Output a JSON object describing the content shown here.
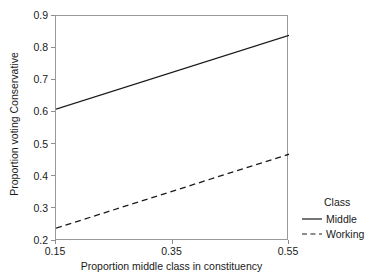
{
  "chart_data": {
    "type": "line",
    "title": "",
    "xlabel": "Proportion middle class in constituency",
    "ylabel": "Proportion voting Conservative",
    "xlim": [
      0.15,
      0.55
    ],
    "ylim": [
      0.2,
      0.9
    ],
    "xticks": [
      "0.15",
      "0.35",
      "0.55"
    ],
    "xtick_values": [
      0.15,
      0.35,
      0.55
    ],
    "yticks": [
      "0.2",
      "0.3",
      "0.4",
      "0.5",
      "0.6",
      "0.7",
      "0.8",
      "0.9"
    ],
    "ytick_values": [
      0.2,
      0.3,
      0.4,
      0.5,
      0.6,
      0.7,
      0.8,
      0.9
    ],
    "grid": false,
    "legend_position": "right",
    "x": [
      0.15,
      0.55
    ],
    "series": [
      {
        "name": "Middle",
        "style": "solid",
        "color": "#1a1a1a",
        "values": [
          0.61,
          0.84
        ]
      },
      {
        "name": "Working",
        "style": "dashed",
        "color": "#1a1a1a",
        "values": [
          0.24,
          0.47
        ]
      }
    ],
    "legend": {
      "title": "Class",
      "entries": [
        {
          "label": "Middle",
          "style": "solid"
        },
        {
          "label": "Working",
          "style": "dashed"
        }
      ]
    }
  },
  "axis": {
    "x_title": "Proportion middle class in constituency",
    "y_title": "Proportion voting Conservative"
  },
  "legend": {
    "title": "Class",
    "middle_label": "Middle",
    "working_label": "Working"
  },
  "ticks": {
    "x": [
      "0.15",
      "0.35",
      "0.55"
    ],
    "y": [
      "0.2",
      "0.3",
      "0.4",
      "0.5",
      "0.6",
      "0.7",
      "0.8",
      "0.9"
    ]
  },
  "colors": {
    "line": "#1a1a1a",
    "frame": "#9a9a9a",
    "background": "#ffffff"
  }
}
